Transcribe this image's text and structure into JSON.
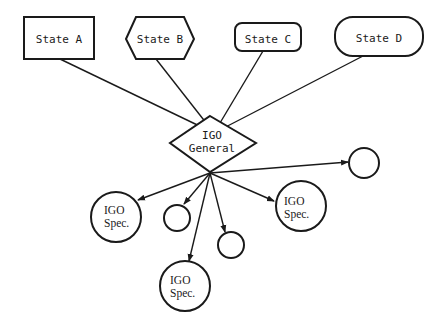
{
  "diagram": {
    "states": [
      {
        "id": "state-a",
        "label": "State A",
        "shape": "rectangle"
      },
      {
        "id": "state-b",
        "label": "State B",
        "shape": "hexagon"
      },
      {
        "id": "state-c",
        "label": "State C",
        "shape": "rounded-rectangle"
      },
      {
        "id": "state-d",
        "label": "State D",
        "shape": "stadium"
      }
    ],
    "hub": {
      "id": "igo-general",
      "line1": "IGO",
      "line2": "General",
      "shape": "diamond"
    },
    "specialized": [
      {
        "id": "igo-spec-1",
        "line1": "IGO",
        "line2": "Spec.",
        "shape": "circle"
      },
      {
        "id": "igo-spec-2",
        "line1": "IGO",
        "line2": "Spec.",
        "shape": "circle"
      },
      {
        "id": "igo-spec-3",
        "line1": "IGO",
        "line2": "Spec.",
        "shape": "circle"
      }
    ],
    "unlabeled_nodes": 3,
    "edges": {
      "state_to_general": [
        "state-a",
        "state-b",
        "state-c",
        "state-d"
      ],
      "general_to_children_arrows": 6
    },
    "colors": {
      "stroke": "#1a1a1a",
      "background": "#ffffff"
    }
  }
}
